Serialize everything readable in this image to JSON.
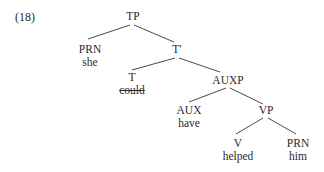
{
  "example": {
    "number": "(18)"
  },
  "tree": {
    "nodes": {
      "tp": {
        "label": "TP"
      },
      "prn1": {
        "label": "PRN",
        "word": "she"
      },
      "tbar": {
        "label": "T′"
      },
      "t": {
        "label": "T",
        "word": "could",
        "word_struck": true
      },
      "auxp": {
        "label": "AUXP"
      },
      "aux": {
        "label": "AUX",
        "word": "have"
      },
      "vp": {
        "label": "VP"
      },
      "v": {
        "label": "V",
        "word": "helped"
      },
      "prn2": {
        "label": "PRN",
        "word": "him"
      }
    },
    "edges": [
      [
        "tp",
        "prn1"
      ],
      [
        "tp",
        "tbar"
      ],
      [
        "tbar",
        "t"
      ],
      [
        "tbar",
        "auxp"
      ],
      [
        "auxp",
        "aux"
      ],
      [
        "auxp",
        "vp"
      ],
      [
        "vp",
        "v"
      ],
      [
        "vp",
        "prn2"
      ]
    ]
  }
}
